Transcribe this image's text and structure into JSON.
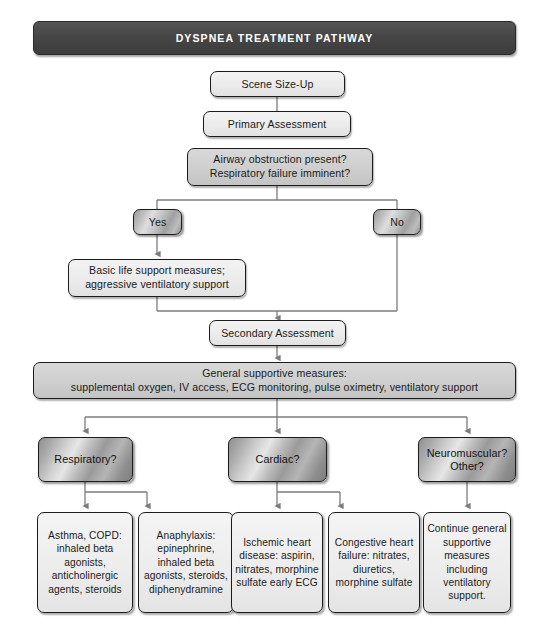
{
  "header": {
    "title": "DYSPNEA TREATMENT PATHWAY"
  },
  "nodes": {
    "scene_size_up": "Scene Size-Up",
    "primary_assessment": "Primary Assessment",
    "decision_line1": "Airway obstruction present?",
    "decision_line2": "Respiratory failure imminent?",
    "yes": "Yes",
    "no": "No",
    "bls_line1": "Basic life support measures;",
    "bls_line2": "aggressive ventilatory support",
    "secondary_assessment": "Secondary Assessment",
    "general_line1": "General supportive measures:",
    "general_line2": "supplemental oxygen, IV access, ECG monitoring, pulse oximetry, ventilatory support",
    "respiratory": "Respiratory?",
    "cardiac": "Cardiac?",
    "neuromuscular_line1": "Neuromuscular?",
    "neuromuscular_line2": "Other?",
    "asthma_copd": "Asthma, COPD: inhaled beta agonists, anticholinergic agents, steroids",
    "anaphylaxis": "Anaphylaxis: epinephrine, inhaled beta agonists, steroids, diphenydramine",
    "ischemic": "Ischemic heart disease: aspirin, nitrates, morphine sulfate early ECG",
    "congestive": "Congestive heart failure: nitrates, diuretics, morphine sulfate",
    "continue_care": "Continue general supportive measures including ventilatory support."
  },
  "colors": {
    "banner_bg": "#464646",
    "banner_text": "#ffffff",
    "node_border": "#1c1c1c",
    "light_fill": "#ececec",
    "mid_fill": "#cfcfcf",
    "metal_fill": "#b5b5b5",
    "connector": "#6b6b6b"
  }
}
